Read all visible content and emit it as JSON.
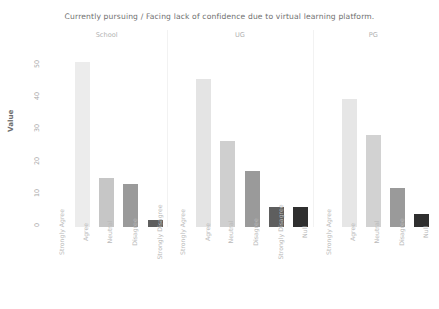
{
  "chart_data": {
    "type": "bar",
    "title": "Currently pursuing / Facing lack of confidence due to virtual learning platform.",
    "xlabel": "",
    "ylabel": "Value",
    "ylim": [
      0,
      55
    ],
    "yticks": [
      "50",
      "40",
      "30",
      "20",
      "10",
      "0"
    ],
    "grid": false,
    "legend": "none",
    "facet_variable": "Currently pursuing",
    "facets": [
      {
        "name": "School",
        "categories": [
          "Strongly Agree",
          "Agree",
          "Neutral",
          "Disagree",
          "Strongly Disagree"
        ],
        "values": [
          0,
          50,
          15,
          13,
          2
        ],
        "colors": [
          "#f2f2f2",
          "#ececec",
          "#c6c6c6",
          "#9a9a9a",
          "#5e5e5e"
        ]
      },
      {
        "name": "UG",
        "categories": [
          "Strongly Agree",
          "Agree",
          "Neutral",
          "Disagree",
          "Strongly Disagree",
          "Null"
        ],
        "values": [
          0,
          45,
          26,
          17,
          6,
          6
        ],
        "colors": [
          "#f2f2f2",
          "#e4e4e4",
          "#cfcfcf",
          "#9a9a9a",
          "#5e5e5e",
          "#2f2f2f"
        ]
      },
      {
        "name": "PG",
        "categories": [
          "Strongly Agree",
          "Agree",
          "Neutral",
          "Disagree",
          "Null"
        ],
        "values": [
          0,
          39,
          28,
          12,
          4
        ],
        "colors": [
          "#f2f2f2",
          "#e6e6e6",
          "#d2d2d2",
          "#9a9a9a",
          "#2f2f2f"
        ]
      }
    ]
  }
}
